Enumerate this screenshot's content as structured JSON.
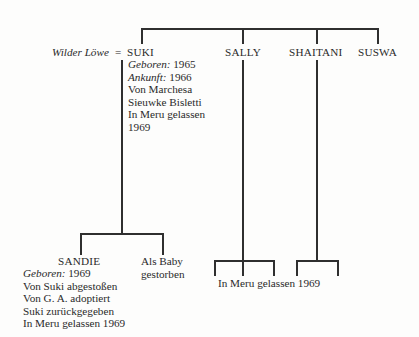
{
  "parents": {
    "father": "Wilder Löwe",
    "marriage_symbol": "=",
    "mother": "SUKI"
  },
  "suki": {
    "name": "SUKI",
    "born_label": "Geboren:",
    "born_value": "1965",
    "arrival_label": "Ankunft:",
    "arrival_value": "1966",
    "notes": [
      "Von Marchesa",
      "Sieuwke Bisletti",
      "In Meru gelassen",
      "1969"
    ]
  },
  "siblings": [
    {
      "name": "SALLY"
    },
    {
      "name": "SHAITANI"
    },
    {
      "name": "SUSWA"
    }
  ],
  "suki_offspring": {
    "sandie": {
      "name": "SANDIE",
      "born_label": "Geboren:",
      "born_value": "1969",
      "notes": [
        "Von Suki abgestoßen",
        "Von G. A. adoptiert",
        "Suki zurückgegeben",
        "In Meru gelassen 1969"
      ]
    },
    "other": {
      "notes": [
        "Als Baby",
        "gestorben"
      ]
    }
  },
  "sally_shaitani_offspring": {
    "note": "In Meru gelassen 1969"
  }
}
